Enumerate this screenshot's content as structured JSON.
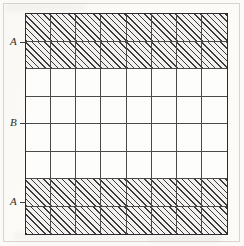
{
  "figure": {
    "type": "hatched-grid-diagram",
    "grid": {
      "columns": 8,
      "rows": 8,
      "shading_legend": {
        "hatched": "diagonal hatch fill",
        "plain": "white / unfilled"
      },
      "row_fills": [
        "hatched",
        "hatched",
        "plain",
        "plain",
        "plain",
        "plain",
        "hatched",
        "hatched"
      ]
    },
    "labels": [
      {
        "id": "label-a-top",
        "text": "A",
        "position": "left",
        "at_row_boundary": 2
      },
      {
        "id": "label-b-middle",
        "text": "B",
        "position": "left",
        "at_row_boundary": 5
      },
      {
        "id": "label-a-bottom",
        "text": "A",
        "position": "left",
        "at_row_boundary": 7
      }
    ],
    "colors": {
      "paper": "#fbfaf7",
      "grid_outer_line": "#2c2c2c",
      "grid_inner_line": "#4a4a4a",
      "hatch_line": "#3a3a3a",
      "hatch_background": "#f2f1ef",
      "plain_cell": "#fdfdfc",
      "label_text": "#2e2e2e",
      "frame": "#d8d5cf"
    }
  },
  "chart_data": {
    "type": "heatmap",
    "title": "",
    "xlabel": "",
    "ylabel": "",
    "categories": [
      "1",
      "2",
      "3",
      "4",
      "5",
      "6",
      "7",
      "8"
    ],
    "row_labels": [
      "1",
      "2",
      "3",
      "4",
      "5",
      "6",
      "7",
      "8"
    ],
    "legend": [
      "hatched",
      "plain"
    ],
    "grid": true,
    "values": [
      [
        1,
        1,
        1,
        1,
        1,
        1,
        1,
        1
      ],
      [
        1,
        1,
        1,
        1,
        1,
        1,
        1,
        1
      ],
      [
        0,
        0,
        0,
        0,
        0,
        0,
        0,
        0
      ],
      [
        0,
        0,
        0,
        0,
        0,
        0,
        0,
        0
      ],
      [
        0,
        0,
        0,
        0,
        0,
        0,
        0,
        0
      ],
      [
        0,
        0,
        0,
        0,
        0,
        0,
        0,
        0
      ],
      [
        1,
        1,
        1,
        1,
        1,
        1,
        1,
        1
      ],
      [
        1,
        1,
        1,
        1,
        1,
        1,
        1,
        1
      ]
    ],
    "annotations": [
      {
        "text": "A",
        "side": "left",
        "row": 2
      },
      {
        "text": "B",
        "side": "left",
        "row": 5
      },
      {
        "text": "A",
        "side": "left",
        "row": 7
      }
    ]
  }
}
